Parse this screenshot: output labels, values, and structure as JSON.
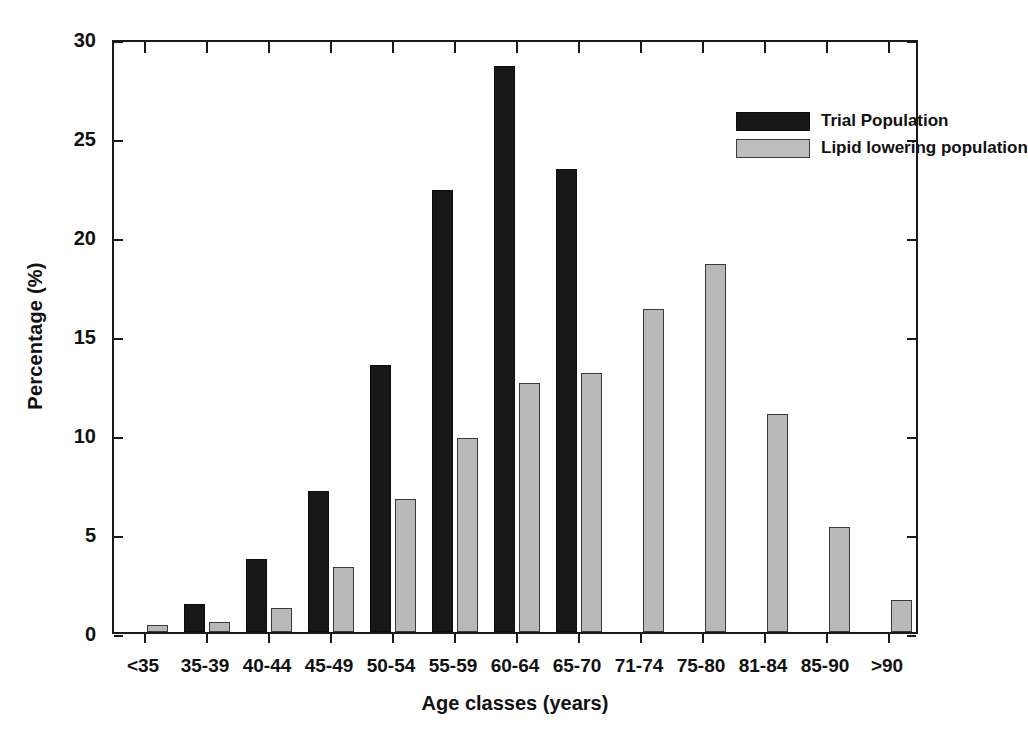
{
  "chart_data": {
    "type": "bar",
    "title": "",
    "xlabel": "Age classes (years)",
    "ylabel": "Percentage (%)",
    "ylim": [
      0,
      30
    ],
    "yticks": [
      0,
      5,
      10,
      15,
      20,
      25,
      30
    ],
    "ytick_labels": [
      "0",
      "5",
      "10",
      "15",
      "20",
      "25",
      "30"
    ],
    "grid": false,
    "legend_position": "top-right",
    "categories": [
      "<35",
      "35-39",
      "40-44",
      "45-49",
      "50-54",
      "55-59",
      "60-64",
      "65-70",
      "71-74",
      "75-80",
      "81-84",
      "85-90",
      ">90"
    ],
    "series": [
      {
        "name": "Trial Population",
        "color": "#171717",
        "values": [
          0,
          1.4,
          3.7,
          7.1,
          13.5,
          22.3,
          28.6,
          23.4,
          0,
          0,
          0,
          0,
          0
        ]
      },
      {
        "name": "Lipid lowering population",
        "color": "#b9b9b9",
        "values": [
          0.35,
          0.5,
          1.2,
          3.3,
          6.7,
          9.8,
          12.6,
          13.1,
          16.3,
          18.6,
          11.0,
          5.3,
          1.6
        ]
      }
    ]
  },
  "legend": {
    "items": [
      {
        "label": "Trial Population",
        "swatch": "trial"
      },
      {
        "label": "Lipid lowering population",
        "swatch": "lipid"
      }
    ]
  },
  "axes": {
    "y_title": "Percentage (%)",
    "x_title": "Age classes (years)"
  }
}
